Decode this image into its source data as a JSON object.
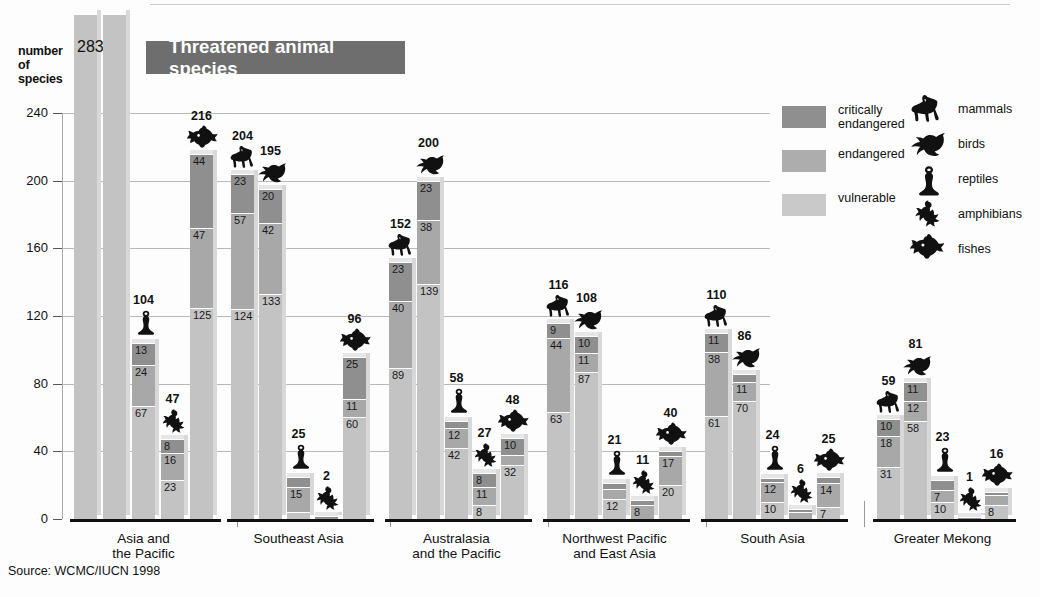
{
  "banner": {
    "title": "Threatened animal species"
  },
  "axis": {
    "y_title_lines": [
      "number",
      "of",
      "species"
    ],
    "y_ticks": [
      "240",
      "200",
      "160",
      "120",
      "80",
      "40",
      "0"
    ]
  },
  "source": "Source: WCMC/IUCN 1998",
  "legend": {
    "status": [
      {
        "key": "crit",
        "label": "critically\nendangered",
        "label_line1": "critically",
        "label_line2": "endangered",
        "color": "#8f8f8f"
      },
      {
        "key": "endg",
        "label": "endangered",
        "label_line1": "endangered",
        "label_line2": "",
        "color": "#adadad"
      },
      {
        "key": "vuln",
        "label": "vulnerable",
        "label_line1": "vulnerable",
        "label_line2": "",
        "color": "#c9c9c9"
      }
    ],
    "animals": [
      {
        "key": "mammals",
        "label": "mammals"
      },
      {
        "key": "birds",
        "label": "birds"
      },
      {
        "key": "reptiles",
        "label": "reptiles"
      },
      {
        "key": "amphibians",
        "label": "amphibians"
      },
      {
        "key": "fishes",
        "label": "fishes"
      }
    ]
  },
  "chart_data": {
    "type": "bar",
    "title": "Threatened animal species",
    "subtype": "stacked-grouped",
    "xlabel": "",
    "ylabel": "number of species",
    "ylim": [
      0,
      240
    ],
    "yticks": [
      0,
      40,
      80,
      120,
      160,
      200,
      240
    ],
    "grid": true,
    "legend_position": "right",
    "stack_order": [
      "critically endangered",
      "endangered",
      "vulnerable"
    ],
    "series_names": [
      "mammals",
      "birds",
      "reptiles",
      "amphibians",
      "fishes"
    ],
    "categories": [
      "Asia and the Pacific",
      "Southeast Asia",
      "Australasia and the Pacific",
      "Northwest Pacific and East Asia",
      "South Asia",
      "Greater Mekong"
    ],
    "note": "The mammals and birds bars of the first group (Asia and the Pacific) extend above the top of the cropped image; only the total 283 is visible on the mammals bar.",
    "groups": [
      {
        "name": "Asia and the Pacific",
        "label_lines": [
          "Asia and",
          "the Pacific"
        ],
        "bars": [
          {
            "animal": "mammals",
            "total": 283,
            "total_visible": true,
            "clipped": true,
            "segments": []
          },
          {
            "animal": "birds",
            "total": null,
            "total_visible": false,
            "clipped": true,
            "segments": []
          },
          {
            "animal": "reptiles",
            "total": 104,
            "total_visible": true,
            "clipped": false,
            "segments": [
              13,
              24,
              67
            ]
          },
          {
            "animal": "amphibians",
            "total": 47,
            "total_visible": true,
            "clipped": false,
            "segments": [
              8,
              16,
              23
            ]
          },
          {
            "animal": "fishes",
            "total": 216,
            "total_visible": true,
            "clipped": false,
            "segments": [
              44,
              47,
              125
            ]
          }
        ]
      },
      {
        "name": "Southeast Asia",
        "label_lines": [
          "Southeast Asia"
        ],
        "bars": [
          {
            "animal": "mammals",
            "total": 204,
            "total_visible": true,
            "clipped": false,
            "segments": [
              23,
              57,
              124
            ]
          },
          {
            "animal": "birds",
            "total": 195,
            "total_visible": true,
            "clipped": false,
            "segments": [
              20,
              42,
              133
            ]
          },
          {
            "animal": "reptiles",
            "total": 25,
            "total_visible": true,
            "clipped": false,
            "segments": [
              6,
              15,
              4
            ]
          },
          {
            "animal": "amphibians",
            "total": 2,
            "total_visible": true,
            "clipped": false,
            "segments": [
              2
            ]
          },
          {
            "animal": "fishes",
            "total": 96,
            "total_visible": true,
            "clipped": false,
            "segments": [
              25,
              11,
              60
            ]
          }
        ]
      },
      {
        "name": "Australasia and the Pacific",
        "label_lines": [
          "Australasia",
          "and the Pacific"
        ],
        "bars": [
          {
            "animal": "mammals",
            "total": 152,
            "total_visible": true,
            "clipped": false,
            "segments": [
              23,
              40,
              89
            ]
          },
          {
            "animal": "birds",
            "total": 200,
            "total_visible": true,
            "clipped": false,
            "segments": [
              23,
              38,
              139
            ]
          },
          {
            "animal": "reptiles",
            "total": 58,
            "total_visible": true,
            "clipped": false,
            "segments": [
              4,
              12,
              42
            ]
          },
          {
            "animal": "amphibians",
            "total": 27,
            "total_visible": true,
            "clipped": false,
            "segments": [
              8,
              11,
              8
            ]
          },
          {
            "animal": "fishes",
            "total": 48,
            "total_visible": true,
            "clipped": false,
            "segments": [
              10,
              6,
              32
            ]
          }
        ]
      },
      {
        "name": "Northwest Pacific and East Asia",
        "label_lines": [
          "Northwest Pacific",
          "and East Asia"
        ],
        "bars": [
          {
            "animal": "mammals",
            "total": 116,
            "total_visible": true,
            "clipped": false,
            "segments": [
              9,
              44,
              63
            ]
          },
          {
            "animal": "birds",
            "total": 108,
            "total_visible": true,
            "clipped": false,
            "segments": [
              10,
              11,
              87
            ]
          },
          {
            "animal": "reptiles",
            "total": 21,
            "total_visible": true,
            "clipped": false,
            "segments": [
              3,
              6,
              12
            ]
          },
          {
            "animal": "amphibians",
            "total": 11,
            "total_visible": true,
            "clipped": false,
            "segments": [
              3,
              8
            ]
          },
          {
            "animal": "fishes",
            "total": 40,
            "total_visible": true,
            "clipped": false,
            "segments": [
              3,
              17,
              20
            ]
          }
        ]
      },
      {
        "name": "South Asia",
        "label_lines": [
          "South Asia"
        ],
        "bars": [
          {
            "animal": "mammals",
            "total": 110,
            "total_visible": true,
            "clipped": false,
            "segments": [
              11,
              38,
              61
            ]
          },
          {
            "animal": "birds",
            "total": 86,
            "total_visible": true,
            "clipped": false,
            "segments": [
              5,
              11,
              70
            ]
          },
          {
            "animal": "reptiles",
            "total": 24,
            "total_visible": true,
            "clipped": false,
            "segments": [
              2,
              12,
              10
            ]
          },
          {
            "animal": "amphibians",
            "total": 6,
            "total_visible": true,
            "clipped": false,
            "segments": [
              2,
              4
            ]
          },
          {
            "animal": "fishes",
            "total": 25,
            "total_visible": true,
            "clipped": false,
            "segments": [
              4,
              14,
              7
            ]
          }
        ]
      },
      {
        "name": "Greater Mekong",
        "label_lines": [
          "Greater Mekong"
        ],
        "bars": [
          {
            "animal": "mammals",
            "total": 59,
            "total_visible": true,
            "clipped": false,
            "segments": [
              10,
              18,
              31
            ]
          },
          {
            "animal": "birds",
            "total": 81,
            "total_visible": true,
            "clipped": false,
            "segments": [
              11,
              12,
              58
            ]
          },
          {
            "animal": "reptiles",
            "total": 23,
            "total_visible": true,
            "clipped": false,
            "segments": [
              6,
              7,
              10
            ]
          },
          {
            "animal": "amphibians",
            "total": 1,
            "total_visible": true,
            "clipped": false,
            "segments": [
              1
            ]
          },
          {
            "animal": "fishes",
            "total": 16,
            "total_visible": true,
            "clipped": false,
            "segments": [
              2,
              6,
              8
            ]
          }
        ]
      }
    ]
  }
}
